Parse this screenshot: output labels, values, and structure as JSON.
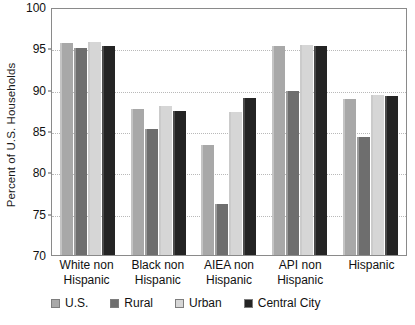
{
  "chart_data": {
    "type": "bar",
    "title": "",
    "xlabel": "",
    "ylabel": "Percent of U.S. Households",
    "ylim": [
      70,
      100
    ],
    "ytick_step": 5,
    "yticks": [
      100,
      95,
      90,
      85,
      80,
      75,
      70
    ],
    "grid": true,
    "legend_position": "bottom",
    "categories": [
      "White non Hispanic",
      "Black non Hispanic",
      "AIEA non Hispanic",
      "API non Hispanic",
      "Hispanic"
    ],
    "category_lines": [
      [
        "White non",
        "Hispanic"
      ],
      [
        "Black non",
        "Hispanic"
      ],
      [
        "AIEA non",
        "Hispanic"
      ],
      [
        "API non",
        "Hispanic"
      ],
      [
        "Hispanic",
        ""
      ]
    ],
    "series": [
      {
        "name": "U.S.",
        "color": "#a8a8a8",
        "values": [
          95.7,
          87.7,
          83.3,
          95.3,
          88.9
        ]
      },
      {
        "name": "Rural",
        "color": "#6e6e6e",
        "values": [
          95.0,
          85.3,
          76.2,
          89.8,
          84.3
        ]
      },
      {
        "name": "Urban",
        "color": "#d6d6d6",
        "values": [
          95.8,
          88.0,
          87.3,
          95.4,
          89.3
        ]
      },
      {
        "name": "Central City",
        "color": "#242424",
        "values": [
          95.3,
          87.4,
          89.0,
          95.3,
          89.2
        ]
      }
    ]
  },
  "colors": {
    "plot_border": "#8a8a8a",
    "gridline": "#b9b9b9",
    "text": "#111111",
    "background": "#ffffff"
  }
}
